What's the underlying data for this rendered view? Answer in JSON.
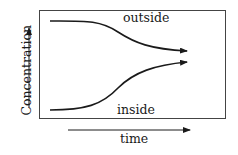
{
  "diagram": {
    "y_axis_label": "Concentration",
    "x_axis_label": "time",
    "curves": [
      {
        "name": "outside",
        "label": "outside",
        "trend": "decreasing"
      },
      {
        "name": "inside",
        "label": "inside",
        "trend": "increasing"
      }
    ],
    "colors": {
      "line": "#1a1a1a",
      "frame": "#444444",
      "background": "#ffffff"
    }
  }
}
